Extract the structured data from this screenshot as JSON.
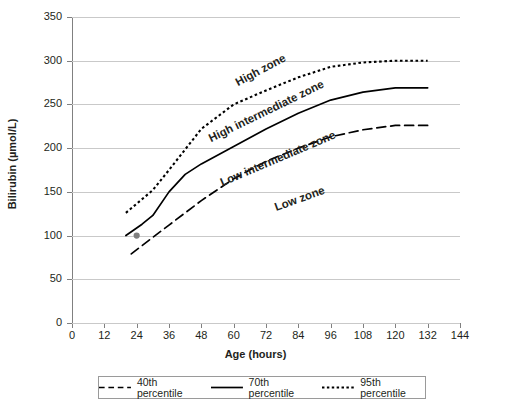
{
  "chart_data": {
    "type": "line",
    "title": "",
    "xlabel": "Age (hours)",
    "ylabel": "Bilirubin (µmol/L)",
    "xlim": [
      0,
      144
    ],
    "ylim": [
      0,
      350
    ],
    "xticks": [
      0,
      12,
      24,
      36,
      48,
      60,
      72,
      84,
      96,
      108,
      120,
      132,
      144
    ],
    "yticks": [
      0,
      50,
      100,
      150,
      200,
      250,
      300,
      350
    ],
    "grid": "horizontal",
    "legend_position": "bottom",
    "series": [
      {
        "name": "40th percentile",
        "style": "dashed",
        "color": "#000000",
        "x": [
          22,
          30,
          36,
          48,
          60,
          72,
          84,
          96,
          108,
          120,
          132
        ],
        "values": [
          79,
          98,
          112,
          140,
          165,
          185,
          200,
          213,
          221,
          226,
          226
        ]
      },
      {
        "name": "70th percentile",
        "style": "solid",
        "color": "#000000",
        "x": [
          20,
          26,
          30,
          36,
          42,
          48,
          60,
          72,
          84,
          96,
          108,
          120,
          132
        ],
        "values": [
          100,
          113,
          123,
          150,
          170,
          182,
          202,
          222,
          240,
          255,
          264,
          269,
          269
        ]
      },
      {
        "name": "95th percentile",
        "style": "dotted",
        "color": "#000000",
        "x": [
          20,
          30,
          36,
          48,
          60,
          72,
          84,
          96,
          108,
          120,
          132
        ],
        "values": [
          126,
          152,
          175,
          222,
          250,
          266,
          281,
          293,
          298,
          300,
          300
        ]
      }
    ],
    "markers": [
      {
        "name": "patient-point",
        "x": 24,
        "y": 100,
        "color": "#808080"
      }
    ],
    "annotations": [
      {
        "name": "high-zone",
        "text": "High zone",
        "x": 62,
        "y": 282,
        "rotation": -28
      },
      {
        "name": "high-intermediate-zone",
        "text": "High intermediate zone",
        "x": 52,
        "y": 218,
        "rotation": -26
      },
      {
        "name": "low-intermediate-zone",
        "text": "Low intermediate zone",
        "x": 56,
        "y": 168,
        "rotation": -23
      },
      {
        "name": "low-zone",
        "text": "Low zone",
        "x": 76,
        "y": 140,
        "rotation": -20
      }
    ]
  },
  "legend": {
    "items": [
      {
        "label": "40th percentile",
        "style": "dashed"
      },
      {
        "label": "70th percentile",
        "style": "solid"
      },
      {
        "label": "95th percentile",
        "style": "dotted"
      }
    ]
  }
}
